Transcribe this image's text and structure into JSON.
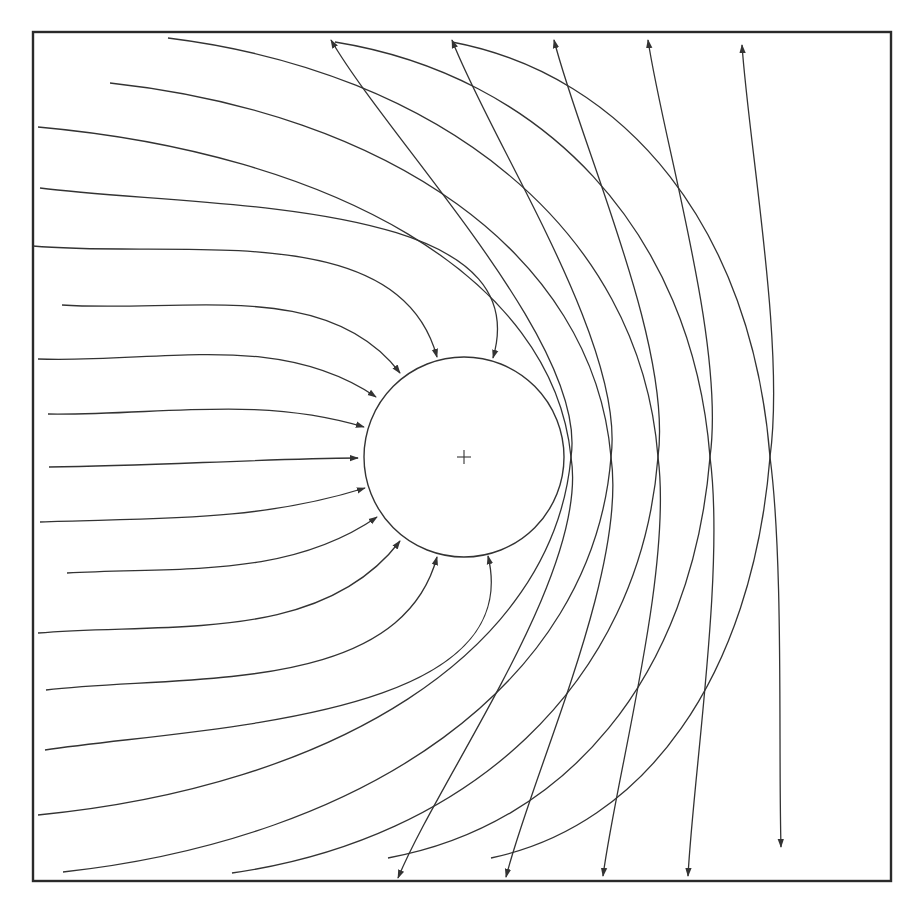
{
  "diagram": {
    "title": "",
    "colors": {
      "stroke": "#333333",
      "background": "#ffffff",
      "frame": "#2a2a2a"
    },
    "frame": {
      "x": 33,
      "y": 32,
      "width": 858,
      "height": 849
    },
    "body": {
      "shape": "circle",
      "cx": 464,
      "cy": 457,
      "r": 100,
      "center_marker": "plus",
      "marker_size": 7
    },
    "axis_y": 457,
    "impacting_trajectories": [
      {
        "from": [
          40,
          188
        ],
        "to": [
          493,
          358
        ]
      },
      {
        "from": [
          33,
          246
        ],
        "to": [
          437,
          357
        ]
      },
      {
        "from": [
          62,
          305
        ],
        "to": [
          400,
          373
        ]
      },
      {
        "from": [
          38,
          359
        ],
        "to": [
          376,
          397
        ]
      },
      {
        "from": [
          48,
          414
        ],
        "to": [
          364,
          427
        ]
      },
      {
        "from": [
          49,
          467
        ],
        "to": [
          358,
          458
        ]
      },
      {
        "from": [
          40,
          522
        ],
        "to": [
          365,
          488
        ]
      },
      {
        "from": [
          67,
          573
        ],
        "to": [
          377,
          517
        ]
      },
      {
        "from": [
          38,
          633
        ],
        "to": [
          400,
          541
        ]
      },
      {
        "from": [
          46,
          690
        ],
        "to": [
          437,
          557
        ]
      },
      {
        "from": [
          45,
          750
        ],
        "to": [
          488,
          556
        ]
      }
    ],
    "deflected_trajectories_top_source": [
      {
        "from": [
          38,
          127
        ],
        "axis_cross_x": 571,
        "to": [
          398,
          878
        ]
      },
      {
        "from": [
          110,
          83
        ],
        "axis_cross_x": 611,
        "to": [
          506,
          877
        ]
      },
      {
        "from": [
          168,
          38
        ],
        "axis_cross_x": 658,
        "to": [
          603,
          876
        ]
      },
      {
        "from": [
          335,
          42
        ],
        "axis_cross_x": 710,
        "to": [
          688,
          876
        ]
      },
      {
        "from": [
          452,
          42
        ],
        "axis_cross_x": 770,
        "to": [
          781,
          847
        ]
      }
    ],
    "deflected_trajectories_bottom_source": [
      {
        "from": [
          38,
          815
        ],
        "axis_cross_x": 571,
        "to": [
          331,
          40
        ]
      },
      {
        "from": [
          63,
          872
        ],
        "axis_cross_x": 611,
        "to": [
          452,
          40
        ]
      },
      {
        "from": [
          232,
          873
        ],
        "axis_cross_x": 658,
        "to": [
          554,
          40
        ]
      },
      {
        "from": [
          388,
          858
        ],
        "axis_cross_x": 710,
        "to": [
          648,
          40
        ]
      },
      {
        "from": [
          491,
          858
        ],
        "axis_cross_x": 770,
        "to": [
          742,
          45
        ]
      }
    ],
    "arrow_count": 21
  }
}
